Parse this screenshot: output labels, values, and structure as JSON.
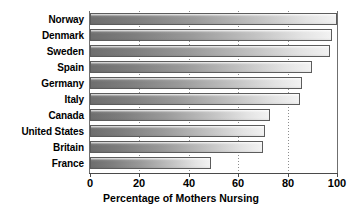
{
  "chart_data": {
    "type": "bar",
    "orientation": "horizontal",
    "title": "",
    "subtitle": "",
    "xlabel": "Percentage of Mothers Nursing",
    "ylabel": "",
    "categories": [
      "Norway",
      "Denmark",
      "Sweden",
      "Spain",
      "Germany",
      "Italy",
      "Canada",
      "United States",
      "Britain",
      "France"
    ],
    "values": [
      100,
      98,
      97,
      90,
      86,
      85,
      73,
      71,
      70,
      49
    ],
    "xlim": [
      0,
      100
    ],
    "xticks": [
      0,
      20,
      40,
      60,
      80,
      100
    ],
    "xtick_labels": [
      "0",
      "20",
      "40",
      "60",
      "80",
      "100"
    ],
    "gridlines": [
      20,
      40,
      60,
      80
    ],
    "grid": true,
    "grid_style": "dotted",
    "legend": "none",
    "bar_fill": "horizontal gradient dark-gray to light-gray",
    "bar_edge_color": "#5c5c5c",
    "axis_color": "#4a4a4a",
    "background_color": "#ffffff",
    "text_color": "#000000"
  },
  "axis": {
    "x_title": "Percentage of Mothers Nursing"
  }
}
